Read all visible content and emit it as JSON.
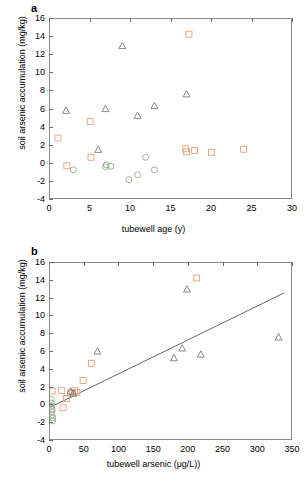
{
  "figure": {
    "panel_a_letter": "a",
    "panel_b_letter": "b",
    "background_color": "#ffffff",
    "axis_color": "#8a8a8a"
  },
  "series_style": {
    "square_color": "#e8a07a",
    "circle_color": "#8aae85",
    "triangle_color": "#7a7a7a",
    "trendline_color": "#555555"
  },
  "chart_data": [
    {
      "type": "scatter",
      "panel": "a",
      "title": "",
      "xlabel": "tubewell age (y)",
      "ylabel": "soil arsenic accumulation (mg/kg)",
      "xlim": [
        0,
        30
      ],
      "ylim": [
        -4,
        16
      ],
      "xticks": [
        0,
        5,
        10,
        15,
        20,
        25,
        30
      ],
      "yticks": [
        -4,
        -2,
        0,
        2,
        4,
        6,
        8,
        10,
        12,
        14,
        16
      ],
      "grid": false,
      "legend": "none",
      "series": [
        {
          "name": "squares",
          "marker": "square",
          "color": "#e8a07a",
          "points": [
            [
              1.0,
              2.7
            ],
            [
              2.1,
              -0.4
            ],
            [
              5.0,
              4.55
            ],
            [
              5.1,
              0.55
            ],
            [
              16.9,
              1.5
            ],
            [
              17.0,
              1.15
            ],
            [
              17.3,
              14.3
            ],
            [
              18.0,
              1.3
            ],
            [
              20.1,
              1.1
            ],
            [
              24.1,
              1.45
            ]
          ]
        },
        {
          "name": "circles",
          "marker": "circle",
          "color": "#8aae85",
          "points": [
            [
              2.9,
              -0.85
            ],
            [
              6.9,
              -0.5
            ],
            [
              7.0,
              -0.3
            ],
            [
              7.6,
              -0.45
            ],
            [
              9.8,
              -1.95
            ],
            [
              10.9,
              -1.4
            ],
            [
              11.9,
              0.55
            ],
            [
              13.0,
              -0.85
            ]
          ]
        },
        {
          "name": "triangles",
          "marker": "triangle",
          "color": "#7a7a7a",
          "points": [
            [
              2.0,
              5.75
            ],
            [
              6.0,
              1.4
            ],
            [
              6.9,
              5.95
            ],
            [
              9.0,
              13.0
            ],
            [
              10.9,
              5.2
            ],
            [
              13.0,
              6.3
            ],
            [
              17.0,
              7.6
            ]
          ]
        }
      ]
    },
    {
      "type": "scatter",
      "panel": "b",
      "title": "",
      "xlabel": "tubewell arsenic (μg/L))",
      "ylabel": "soil arsenic accumulation (mg/kg)",
      "xlim": [
        0,
        350
      ],
      "ylim": [
        -4,
        16
      ],
      "xticks": [
        0,
        50,
        100,
        150,
        200,
        250,
        300,
        350
      ],
      "yticks": [
        -4,
        -2,
        0,
        2,
        4,
        6,
        8,
        10,
        12,
        14,
        16
      ],
      "grid": false,
      "legend": "none",
      "trendline": {
        "x1": 0,
        "y1": -0.4,
        "x2": 340,
        "y2": 12.6,
        "color": "#555555"
      },
      "series": [
        {
          "name": "squares",
          "marker": "square",
          "color": "#e8a07a",
          "points": [
            [
              3,
              1.45
            ],
            [
              17,
              1.5
            ],
            [
              19,
              -0.45
            ],
            [
              24,
              0.6
            ],
            [
              30,
              1.25
            ],
            [
              33,
              1.2
            ],
            [
              36,
              1.5
            ],
            [
              39,
              1.3
            ],
            [
              48,
              2.65
            ],
            [
              60,
              4.6
            ],
            [
              213,
              14.3
            ]
          ]
        },
        {
          "name": "circles",
          "marker": "circle",
          "color": "#8aae85",
          "points": [
            [
              2,
              0.5
            ],
            [
              2,
              0.1
            ],
            [
              2,
              -0.3
            ],
            [
              3,
              -0.6
            ],
            [
              3,
              -0.9
            ],
            [
              3,
              -1.3
            ],
            [
              4,
              -1.6
            ],
            [
              4,
              -1.95
            ]
          ]
        },
        {
          "name": "triangles",
          "marker": "triangle",
          "color": "#7a7a7a",
          "points": [
            [
              30,
              1.4
            ],
            [
              34,
              1.2
            ],
            [
              69,
              5.95
            ],
            [
              180,
              5.2
            ],
            [
              192,
              6.3
            ],
            [
              199,
              13.0
            ],
            [
              219,
              5.6
            ],
            [
              332,
              7.55
            ]
          ]
        }
      ]
    }
  ]
}
